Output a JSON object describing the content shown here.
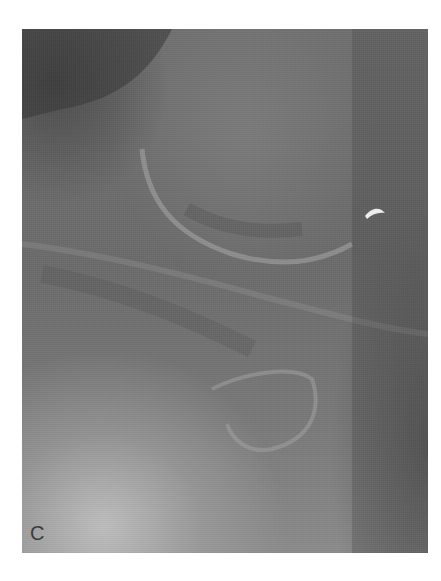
{
  "figure": {
    "panel_label": "C",
    "type": "grayscale radiograph",
    "colors": {
      "background": "#ffffff",
      "image_mid_gray": "#6e6e6e",
      "bright_region": "#c8c8c8",
      "artifact_highlight": "#f0f0f0"
    }
  }
}
